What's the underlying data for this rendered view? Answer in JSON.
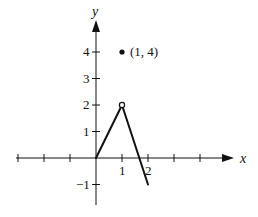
{
  "chart_data": {
    "type": "line",
    "title": "",
    "xlabel": "x",
    "ylabel": "y",
    "xlim": [
      -3.1,
      5.2
    ],
    "ylim": [
      -1.9,
      5.2
    ],
    "grid": false,
    "x_ticks": [
      -3,
      -2,
      -1,
      1,
      2,
      3,
      4
    ],
    "x_tick_labels": [
      {
        "value": 1,
        "label": "1"
      },
      {
        "value": 2,
        "label": "2"
      }
    ],
    "y_ticks": [
      -1,
      1,
      2,
      3,
      4
    ],
    "y_tick_labels": [
      {
        "value": -1,
        "label": "−1"
      },
      {
        "value": 1,
        "label": "1"
      },
      {
        "value": 2,
        "label": "2"
      },
      {
        "value": 3,
        "label": "3"
      },
      {
        "value": 4,
        "label": "4"
      }
    ],
    "series": [
      {
        "name": "segment-1",
        "points": [
          [
            0,
            0
          ],
          [
            1,
            2
          ]
        ]
      },
      {
        "name": "segment-2",
        "points": [
          [
            1,
            2
          ],
          [
            2,
            -1
          ]
        ]
      }
    ],
    "markers": [
      {
        "name": "open-point",
        "x": 1,
        "y": 2,
        "style": "open"
      },
      {
        "name": "filled-point",
        "x": 1,
        "y": 4,
        "style": "filled",
        "label": "(1, 4)"
      }
    ]
  },
  "layout": {
    "origin_px": [
      96,
      158
    ],
    "unit_px_x": 26,
    "unit_px_y": 26.5,
    "x_axis_px": [
      16,
      234
    ],
    "y_axis_px": [
      205,
      20
    ],
    "ink_color": "#111111"
  }
}
